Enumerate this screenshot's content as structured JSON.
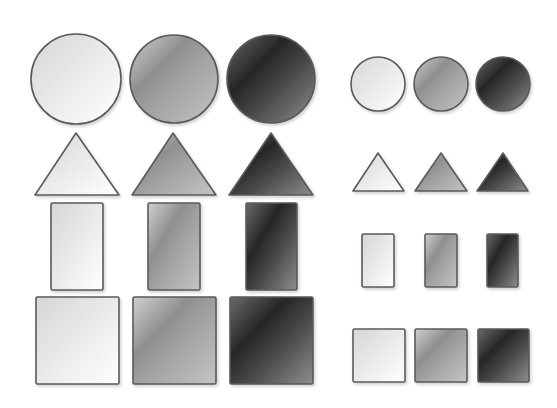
{
  "canvas": {
    "width": 557,
    "height": 408,
    "background": "#ffffff"
  },
  "style": {
    "stroke": "#5a5a5a",
    "stroke_width": 1.6,
    "shadow_color": "#000000",
    "shadow_opacity": 0.18
  },
  "gradients": {
    "light": {
      "name": "light",
      "stops": [
        [
          "0",
          "#d6d6d6"
        ],
        [
          "0.4",
          "#e6e6e6"
        ],
        [
          "1",
          "#ffffff"
        ]
      ]
    },
    "medium": {
      "name": "medium",
      "stops": [
        [
          "0",
          "#d0d0d0"
        ],
        [
          "0.35",
          "#8f8f8f"
        ],
        [
          "0.55",
          "#a2a2a2"
        ],
        [
          "1",
          "#c4c4c4"
        ]
      ]
    },
    "dark": {
      "name": "dark",
      "stops": [
        [
          "0",
          "#6a6a6a"
        ],
        [
          "0.35",
          "#262626"
        ],
        [
          "0.6",
          "#4a4a4a"
        ],
        [
          "1",
          "#8e8e8e"
        ]
      ]
    }
  },
  "groups": [
    {
      "name": "large-set",
      "shapes": [
        {
          "type": "circle",
          "shade": "light",
          "cx": 76,
          "cy": 79,
          "r": 45
        },
        {
          "type": "circle",
          "shade": "medium",
          "cx": 174,
          "cy": 79,
          "r": 44
        },
        {
          "type": "circle",
          "shade": "dark",
          "cx": 271,
          "cy": 79,
          "r": 44
        },
        {
          "type": "triangle",
          "shade": "light",
          "points": "76,133 35,195 119,195"
        },
        {
          "type": "triangle",
          "shade": "medium",
          "points": "173,133 132,195 216,195"
        },
        {
          "type": "triangle",
          "shade": "dark",
          "points": "271,133 229,195 313,195"
        },
        {
          "type": "rect",
          "shade": "light",
          "x": 51,
          "y": 203,
          "w": 52,
          "h": 87
        },
        {
          "type": "rect",
          "shade": "medium",
          "x": 148,
          "y": 203,
          "w": 52,
          "h": 87
        },
        {
          "type": "rect",
          "shade": "dark",
          "x": 246,
          "y": 203,
          "w": 51,
          "h": 87
        },
        {
          "type": "rect",
          "shade": "light",
          "x": 36,
          "y": 297,
          "w": 83,
          "h": 87
        },
        {
          "type": "rect",
          "shade": "medium",
          "x": 133,
          "y": 297,
          "w": 83,
          "h": 87
        },
        {
          "type": "rect",
          "shade": "dark",
          "x": 230,
          "y": 297,
          "w": 83,
          "h": 87
        }
      ]
    },
    {
      "name": "small-set",
      "shapes": [
        {
          "type": "circle",
          "shade": "light",
          "cx": 378,
          "cy": 84,
          "r": 27
        },
        {
          "type": "circle",
          "shade": "medium",
          "cx": 441,
          "cy": 84,
          "r": 27
        },
        {
          "type": "circle",
          "shade": "dark",
          "cx": 503,
          "cy": 84,
          "r": 27
        },
        {
          "type": "triangle",
          "shade": "light",
          "points": "378,153 353,191 404,191"
        },
        {
          "type": "triangle",
          "shade": "medium",
          "points": "441,153 415,191 467,191"
        },
        {
          "type": "triangle",
          "shade": "dark",
          "points": "503,153 477,191 528,191"
        },
        {
          "type": "rect",
          "shade": "light",
          "x": 362,
          "y": 234,
          "w": 32,
          "h": 53
        },
        {
          "type": "rect",
          "shade": "medium",
          "x": 425,
          "y": 234,
          "w": 32,
          "h": 53
        },
        {
          "type": "rect",
          "shade": "dark",
          "x": 487,
          "y": 234,
          "w": 31,
          "h": 53
        },
        {
          "type": "rect",
          "shade": "light",
          "x": 353,
          "y": 329,
          "w": 52,
          "h": 53
        },
        {
          "type": "rect",
          "shade": "medium",
          "x": 415,
          "y": 329,
          "w": 52,
          "h": 53
        },
        {
          "type": "rect",
          "shade": "dark",
          "x": 478,
          "y": 329,
          "w": 51,
          "h": 53
        }
      ]
    }
  ]
}
